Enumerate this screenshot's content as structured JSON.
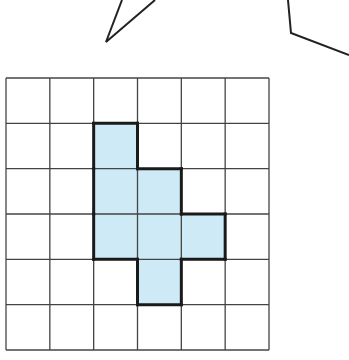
{
  "diagram": {
    "type": "grid-polyomino",
    "grid": {
      "rows": 6,
      "cols": 6
    },
    "shaded_cells": [
      {
        "row": 1,
        "col": 2
      },
      {
        "row": 2,
        "col": 2
      },
      {
        "row": 2,
        "col": 3
      },
      {
        "row": 3,
        "col": 2
      },
      {
        "row": 3,
        "col": 3
      },
      {
        "row": 3,
        "col": 4
      },
      {
        "row": 4,
        "col": 3
      }
    ],
    "colors": {
      "fill": "#cdeaf6",
      "grid_line": "#444444",
      "outline": "#1a1a1a",
      "background": "#ffffff"
    },
    "partial_shapes_above": [
      "angle-shape",
      "bent-line-shape"
    ]
  }
}
